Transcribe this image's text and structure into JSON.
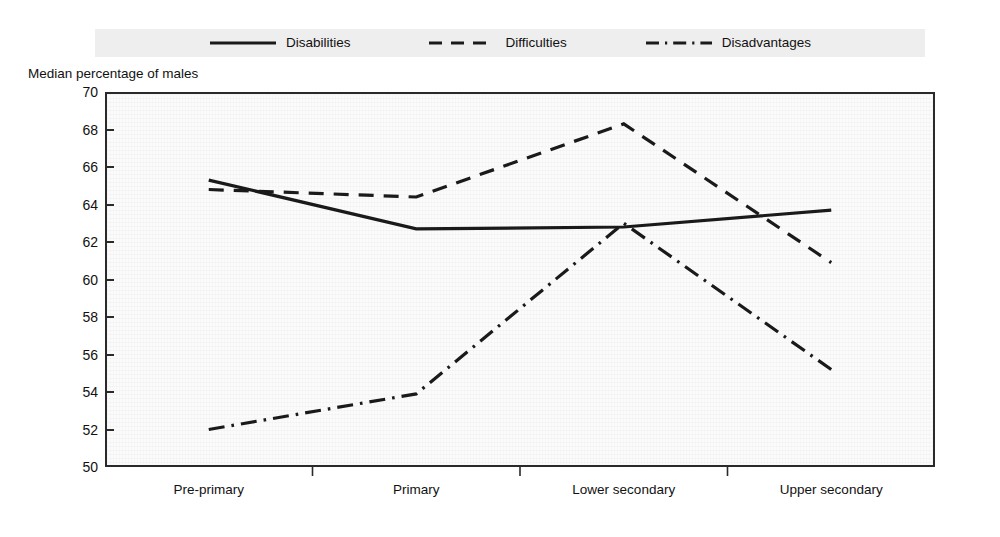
{
  "chart_data": {
    "type": "line",
    "title": "",
    "subtitle": "",
    "xlabel": "",
    "ylabel": "Median percentage of males",
    "categories": [
      "Pre-primary",
      "Primary",
      "Lower secondary",
      "Upper secondary"
    ],
    "ylim": [
      50,
      70
    ],
    "ytick_step": 2,
    "yticks": [
      70,
      68,
      66,
      64,
      62,
      60,
      58,
      56,
      54,
      52,
      50
    ],
    "grid": false,
    "legend_position": "top",
    "series": [
      {
        "name": "Disabilities",
        "line_style": "solid",
        "color": "#1a1a1a",
        "values": [
          65.3,
          62.7,
          62.8,
          63.7
        ]
      },
      {
        "name": "Difficulties",
        "line_style": "dashed",
        "color": "#1a1a1a",
        "values": [
          64.8,
          64.4,
          68.3,
          60.9
        ]
      },
      {
        "name": "Disadvantages",
        "line_style": "dash-dot",
        "color": "#1a1a1a",
        "values": [
          52.0,
          53.9,
          63.0,
          55.2
        ]
      }
    ],
    "annotations": []
  },
  "legend": {
    "items": [
      {
        "label": "Disabilities",
        "swatch": "solid-line-icon"
      },
      {
        "label": "Difficulties",
        "swatch": "dashed-line-icon"
      },
      {
        "label": "Disadvantages",
        "swatch": "dash-dot-line-icon"
      }
    ]
  },
  "colors": {
    "ink": "#1a1a1a",
    "frame": "#2a2a2a",
    "legend_background": "#eeeeee",
    "plot_background": "#fbfbfb"
  }
}
